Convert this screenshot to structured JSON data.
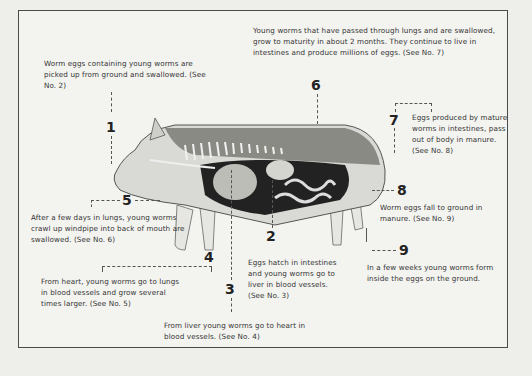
{
  "diagram": {
    "steps": [
      {
        "number": "1",
        "text": "Worm eggs containing young worms are picked up from ground and swallowed. (See No. 2)"
      },
      {
        "number": "2",
        "text": "Eggs hatch in intestines and young worms go to liver in blood vessels. (See No. 3)"
      },
      {
        "number": "3",
        "text": "From liver young worms go to heart in blood vessels. (See No. 4)"
      },
      {
        "number": "4",
        "text": "From heart, young worms go to lungs in blood vessels and grow several times larger. (See No. 5)"
      },
      {
        "number": "5",
        "text": "After a few days in lungs, young worms crawl up windpipe into back of mouth are swallowed. (See No. 6)"
      },
      {
        "number": "6",
        "text": "Young worms that have passed through lungs and are swallowed, grow to maturity in about 2 months. They continue to live in intestines and produce millions of eggs. (See No. 7)"
      },
      {
        "number": "7",
        "text": "Eggs produced by mature worms in intestines, pass out of body in manure. (See No. 8)"
      },
      {
        "number": "8",
        "text": "Worm eggs fall to ground in manure. (See No. 9)"
      },
      {
        "number": "9",
        "text": "In a few weeks young worms form inside the eggs on the ground."
      }
    ],
    "illustration": "pig-cutaway-anatomy"
  }
}
